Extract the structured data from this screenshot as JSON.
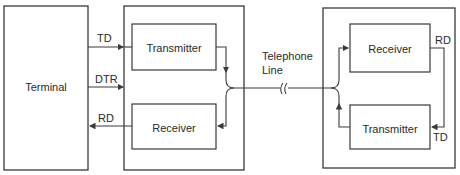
{
  "diagram": {
    "terminal": {
      "label": "Terminal"
    },
    "left_modem": {
      "transmitter": {
        "label": "Transmitter"
      },
      "receiver": {
        "label": "Receiver"
      }
    },
    "right_modem": {
      "receiver": {
        "label": "Receiver"
      },
      "transmitter": {
        "label": "Transmitter"
      }
    },
    "signals": {
      "td_left": "TD",
      "dtr": "DTR",
      "rd_left": "RD",
      "rd_right": "RD",
      "td_right": "TD"
    },
    "telephone_line": {
      "line1": "Telephone",
      "line2": "Line"
    },
    "colors": {
      "stroke": "#3a3a3a",
      "text": "#2a2a2a",
      "background": "#ffffff"
    }
  }
}
